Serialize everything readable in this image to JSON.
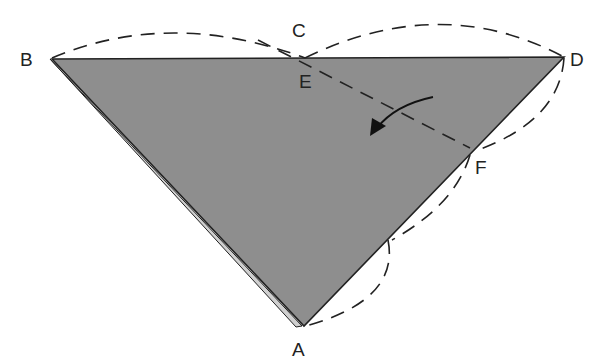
{
  "diagram": {
    "title": "",
    "colors": {
      "fill": "#8e8e8e",
      "stroke": "#222222",
      "back_layer": "#cfcfcf",
      "background": "#ffffff"
    },
    "points": [
      {
        "id": "A",
        "label": "A",
        "x": 302,
        "y": 326
      },
      {
        "id": "B",
        "label": "B",
        "x": 50,
        "y": 59
      },
      {
        "id": "C",
        "label": "C",
        "x": 300,
        "y": 28
      },
      {
        "id": "D",
        "label": "D",
        "x": 564,
        "y": 57
      },
      {
        "id": "E",
        "label": "E",
        "x": 305,
        "y": 60
      },
      {
        "id": "F",
        "label": "F",
        "x": 468,
        "y": 148
      }
    ],
    "labels": {
      "A": "A",
      "B": "B",
      "C": "C",
      "D": "D",
      "E": "E",
      "F": "F"
    },
    "elements": [
      "shaded triangle ABD",
      "dashed arc B to C",
      "dashed arc C to D",
      "dashed arc D to F",
      "dashed arc F to A",
      "dashed fold line through E and F",
      "curved arrow indicating fold direction"
    ]
  }
}
